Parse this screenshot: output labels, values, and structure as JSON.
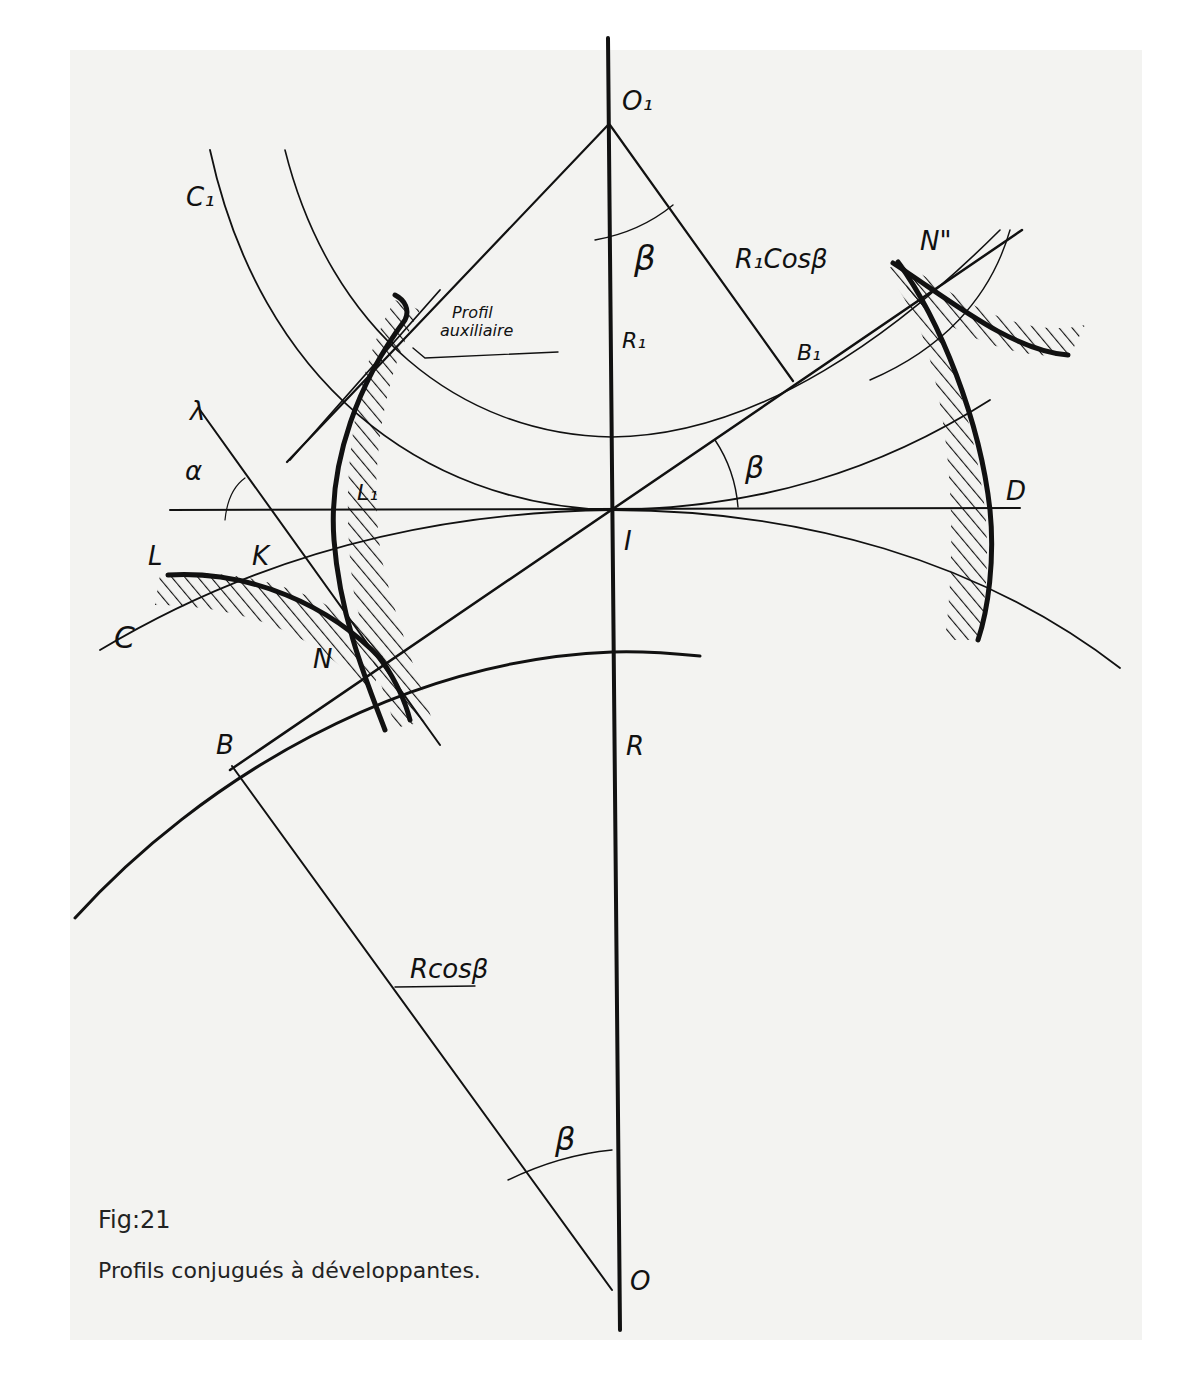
{
  "figure": {
    "number": "Fig:21",
    "caption": "Profils conjugués à développantes."
  },
  "colors": {
    "paper": "#f3f3f1",
    "ink": "#111111",
    "background": "#ffffff"
  },
  "labels": {
    "O1": "O₁",
    "O": "O",
    "I": "I",
    "R1": "R₁",
    "R": "R",
    "B1": "B₁",
    "B": "B",
    "C1": "C₁",
    "C": "C",
    "D": "D",
    "L": "L",
    "L1": "L₁",
    "K": "K",
    "N": "N",
    "N2": "N\"",
    "lambda": "λ",
    "alpha": "α",
    "beta_top": "β",
    "beta_mid": "β",
    "beta_bottom": "β",
    "r1cos": "R₁Cosβ",
    "rcos": "Rcosβ",
    "profil_aux_line1": "Profil",
    "profil_aux_line2": "auxiliaire"
  }
}
